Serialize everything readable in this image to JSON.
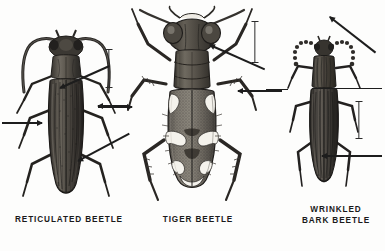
{
  "plate": {
    "kind": "scientific-illustration-plate",
    "medium": "engraving / halftone",
    "background_color": "#fdfdfc",
    "ink_color": "#1d1d1d",
    "subject": "beetles",
    "figure_count": 3
  },
  "figures": [
    {
      "id": "reticulated-beetle",
      "caption": "RETICULATED  BEETLE",
      "position": "left",
      "body_color": "#3a3632",
      "highlight_color": "#8d8880",
      "description": "elongate dark beetle with long antennae and ridged elytra"
    },
    {
      "id": "tiger-beetle",
      "caption": "TIGER  BEETLE",
      "position": "center",
      "body_color": "#4b4845",
      "highlight_color": "#f2f0ea",
      "description": "broad beetle with large eyes and pale maculations on elytra"
    },
    {
      "id": "wrinkled-bark-beetle",
      "caption": "WRINKLED\nBARK  BEETLE",
      "position": "right",
      "body_color": "#35312d",
      "highlight_color": "#857f78",
      "description": "narrow dark beetle with beaded antennae and striate elytra"
    }
  ],
  "scale_bars": [
    {
      "id": "scale-bar-left",
      "for": "reticulated-beetle"
    },
    {
      "id": "scale-bar-center",
      "for": "tiger-beetle"
    },
    {
      "id": "scale-bar-right",
      "for": "wrinkled-bark-beetle"
    }
  ],
  "leaders": [
    {
      "id": "leader-1",
      "target": "reticulated-beetle",
      "direction": "right"
    },
    {
      "id": "leader-2",
      "target": "reticulated-beetle",
      "direction": "down-left"
    },
    {
      "id": "leader-3",
      "target": "reticulated-beetle",
      "direction": "down-left"
    },
    {
      "id": "leader-4",
      "target": "reticulated-beetle",
      "direction": "down-left"
    },
    {
      "id": "leader-5",
      "target": "tiger-beetle",
      "direction": "right"
    },
    {
      "id": "leader-6",
      "target": "tiger-beetle",
      "direction": "left"
    },
    {
      "id": "leader-7",
      "target": "tiger-beetle",
      "direction": "down-left"
    },
    {
      "id": "leader-8",
      "target": "wrinkled-bark-beetle",
      "direction": "down-left"
    },
    {
      "id": "leader-9",
      "target": "wrinkled-bark-beetle",
      "direction": "left"
    },
    {
      "id": "leader-10",
      "target": "wrinkled-bark-beetle",
      "direction": "left"
    }
  ]
}
